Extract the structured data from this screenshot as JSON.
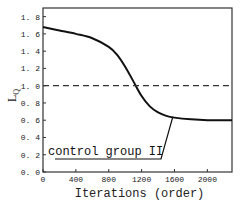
{
  "chart_data": {
    "type": "line",
    "title": "",
    "xlabel": "Iterations (order)",
    "ylabel": "L_Q",
    "xlim": [
      0,
      2300
    ],
    "ylim": [
      0,
      1.9
    ],
    "x_ticks": [
      "0",
      "400",
      "800",
      "1200",
      "1600",
      "2000"
    ],
    "y_ticks": [
      "0.0",
      "0.2",
      "0.4",
      "0.6",
      "0.8",
      "1.0",
      "1.2",
      "1.4",
      "1.6",
      "1.8"
    ],
    "grid": false,
    "series": [
      {
        "name": "control group II",
        "style": "solid",
        "x": [
          0,
          200,
          400,
          600,
          800,
          900,
          1000,
          1100,
          1200,
          1300,
          1400,
          1500,
          1600,
          1800,
          2000,
          2300
        ],
        "y": [
          1.68,
          1.64,
          1.6,
          1.55,
          1.45,
          1.36,
          1.22,
          1.05,
          0.88,
          0.76,
          0.69,
          0.65,
          0.63,
          0.61,
          0.6,
          0.6
        ]
      },
      {
        "name": "reference",
        "style": "dashed",
        "x": [
          0,
          2300
        ],
        "y": [
          1.0,
          1.0
        ]
      }
    ],
    "annotations": [
      {
        "text": "control group II",
        "pointer_to": [
          1580,
          0.64
        ]
      }
    ]
  }
}
